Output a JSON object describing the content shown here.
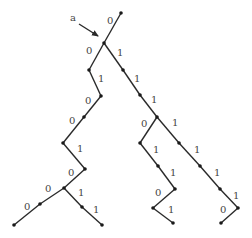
{
  "diagram": {
    "type": "binary-tree",
    "pointer_label": "a",
    "pointer": {
      "text_x": 70,
      "text_y": 21,
      "x1": 79,
      "y1": 24,
      "x2": 98,
      "y2": 36
    },
    "nodes": [
      {
        "id": "n0",
        "x": 121,
        "y": 13
      },
      {
        "id": "n1",
        "x": 104,
        "y": 43
      },
      {
        "id": "n2",
        "x": 89,
        "y": 70
      },
      {
        "id": "n3",
        "x": 101,
        "y": 96
      },
      {
        "id": "n4",
        "x": 84,
        "y": 117
      },
      {
        "id": "n5",
        "x": 63,
        "y": 143
      },
      {
        "id": "n6",
        "x": 85,
        "y": 169
      },
      {
        "id": "n7",
        "x": 64,
        "y": 188
      },
      {
        "id": "n8",
        "x": 40,
        "y": 204
      },
      {
        "id": "n9",
        "x": 14,
        "y": 225
      },
      {
        "id": "n10",
        "x": 82,
        "y": 207
      },
      {
        "id": "n11",
        "x": 102,
        "y": 225
      },
      {
        "id": "n12",
        "x": 123,
        "y": 70
      },
      {
        "id": "n13",
        "x": 140,
        "y": 95
      },
      {
        "id": "n14",
        "x": 157,
        "y": 117
      },
      {
        "id": "n15",
        "x": 140,
        "y": 143
      },
      {
        "id": "n16",
        "x": 158,
        "y": 166
      },
      {
        "id": "n17",
        "x": 175,
        "y": 189
      },
      {
        "id": "n18",
        "x": 153,
        "y": 208
      },
      {
        "id": "n19",
        "x": 173,
        "y": 223
      },
      {
        "id": "n20",
        "x": 179,
        "y": 143
      },
      {
        "id": "n21",
        "x": 200,
        "y": 166
      },
      {
        "id": "n22",
        "x": 220,
        "y": 189
      },
      {
        "id": "n23",
        "x": 238,
        "y": 208
      },
      {
        "id": "n24",
        "x": 221,
        "y": 223
      }
    ],
    "edges": [
      {
        "from": "n0",
        "to": "n1",
        "label": "0",
        "lx": 107,
        "ly": 24
      },
      {
        "from": "n1",
        "to": "n2",
        "label": "0",
        "lx": 86,
        "ly": 54
      },
      {
        "from": "n2",
        "to": "n3",
        "label": "1",
        "lx": 98,
        "ly": 82
      },
      {
        "from": "n3",
        "to": "n4",
        "label": "0",
        "lx": 85,
        "ly": 104
      },
      {
        "from": "n4",
        "to": "n5",
        "label": "0",
        "lx": 69,
        "ly": 124
      },
      {
        "from": "n5",
        "to": "n6",
        "label": "1",
        "lx": 77,
        "ly": 152
      },
      {
        "from": "n6",
        "to": "n7",
        "label": "0",
        "lx": 68,
        "ly": 176
      },
      {
        "from": "n7",
        "to": "n8",
        "label": "0",
        "lx": 45,
        "ly": 192
      },
      {
        "from": "n8",
        "to": "n9",
        "label": "0",
        "lx": 24,
        "ly": 210
      },
      {
        "from": "n7",
        "to": "n10",
        "label": "1",
        "lx": 78,
        "ly": 196
      },
      {
        "from": "n10",
        "to": "n11",
        "label": "1",
        "lx": 93,
        "ly": 213
      },
      {
        "from": "n1",
        "to": "n12",
        "label": "1",
        "lx": 117,
        "ly": 56
      },
      {
        "from": "n12",
        "to": "n13",
        "label": "1",
        "lx": 134,
        "ly": 82
      },
      {
        "from": "n13",
        "to": "n14",
        "label": "1",
        "lx": 151,
        "ly": 103
      },
      {
        "from": "n14",
        "to": "n15",
        "label": "0",
        "lx": 141,
        "ly": 127
      },
      {
        "from": "n15",
        "to": "n16",
        "label": "1",
        "lx": 153,
        "ly": 153
      },
      {
        "from": "n16",
        "to": "n17",
        "label": "1",
        "lx": 170,
        "ly": 176
      },
      {
        "from": "n17",
        "to": "n18",
        "label": "0",
        "lx": 155,
        "ly": 196
      },
      {
        "from": "n18",
        "to": "n19",
        "label": "1",
        "lx": 168,
        "ly": 213
      },
      {
        "from": "n14",
        "to": "n20",
        "label": "1",
        "lx": 172,
        "ly": 126
      },
      {
        "from": "n20",
        "to": "n21",
        "label": "1",
        "lx": 194,
        "ly": 153
      },
      {
        "from": "n21",
        "to": "n22",
        "label": "1",
        "lx": 214,
        "ly": 176
      },
      {
        "from": "n22",
        "to": "n23",
        "label": "1",
        "lx": 233,
        "ly": 199
      },
      {
        "from": "n23",
        "to": "n24",
        "label": "0",
        "lx": 220,
        "ly": 213
      }
    ]
  }
}
